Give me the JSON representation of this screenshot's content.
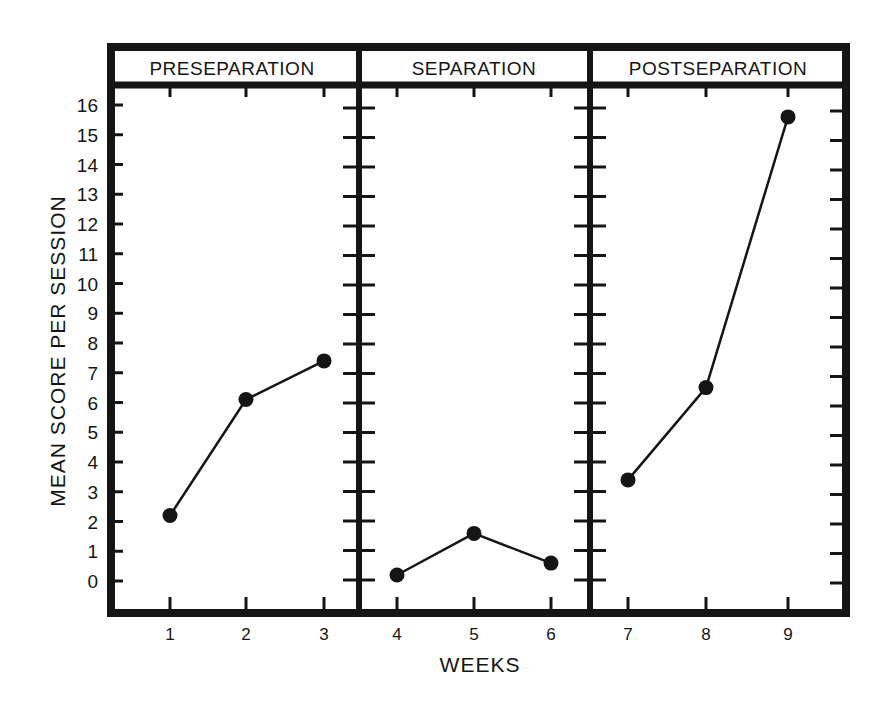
{
  "chart_data": {
    "type": "line",
    "title": "",
    "xlabel": "WEEKS",
    "ylabel": "MEAN SCORE PER SESSION",
    "ylim": [
      0,
      16
    ],
    "y_ticks": [
      "0",
      "1",
      "2",
      "3",
      "4",
      "5",
      "6",
      "7",
      "8",
      "9",
      "10",
      "11",
      "12",
      "13",
      "14",
      "15",
      "16"
    ],
    "x": [
      1,
      2,
      3,
      4,
      5,
      6,
      7,
      8,
      9
    ],
    "categories": [
      "1",
      "2",
      "3",
      "4",
      "5",
      "6",
      "7",
      "8",
      "9"
    ],
    "grid": false,
    "legend": null,
    "panels": [
      {
        "name": "PRESEPARATION",
        "weeks": [
          1,
          2,
          3
        ],
        "values": [
          2.2,
          6.1,
          7.4
        ]
      },
      {
        "name": "SEPARATION",
        "weeks": [
          4,
          5,
          6
        ],
        "values": [
          0.2,
          1.6,
          0.6
        ]
      },
      {
        "name": "POSTSEPARATION",
        "weeks": [
          7,
          8,
          9
        ],
        "values": [
          3.4,
          6.5,
          15.6
        ]
      }
    ],
    "series": [
      {
        "name": "Mean score per session",
        "values": [
          2.2,
          6.1,
          7.4,
          0.2,
          1.6,
          0.6,
          3.4,
          6.5,
          15.6
        ]
      }
    ]
  },
  "labels": {
    "xlabel": "WEEKS",
    "ylabel": "MEAN SCORE PER SESSION",
    "panel_titles": [
      "PRESEPARATION",
      "SEPARATION",
      "POSTSEPARATION"
    ]
  },
  "colors": {
    "ink": "#151515",
    "background": "#ffffff"
  }
}
